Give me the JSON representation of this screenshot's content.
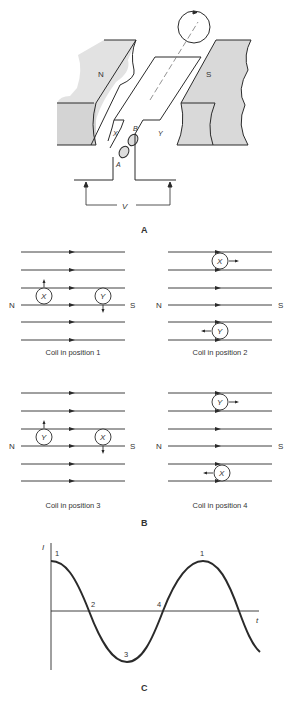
{
  "panel_a": {
    "label": "A",
    "magnet_north": "N",
    "magnet_south": "S",
    "side_x": "X",
    "side_y": "Y",
    "ring_a": "A",
    "ring_b": "B",
    "voltage": "V"
  },
  "panel_b": {
    "label": "B",
    "north": "N",
    "south": "S",
    "positions": [
      {
        "caption": "Coil in position 1",
        "top_conductor": "X",
        "bottom_conductor": "Y"
      },
      {
        "caption": "Coil in position 2",
        "top_conductor": "X",
        "bottom_conductor": "Y"
      },
      {
        "caption": "Coil in position 3",
        "top_conductor": "Y",
        "bottom_conductor": "X"
      },
      {
        "caption": "Coil in position 4",
        "top_conductor": "Y",
        "bottom_conductor": "X"
      }
    ]
  },
  "panel_c": {
    "label": "C",
    "y_axis": "I",
    "x_axis": "t",
    "point_labels": [
      "1",
      "2",
      "3",
      "4",
      "1"
    ]
  },
  "colors": {
    "line": "#2a2a2a",
    "magnet_fill": "#d9d9d9",
    "text": "#333333"
  }
}
